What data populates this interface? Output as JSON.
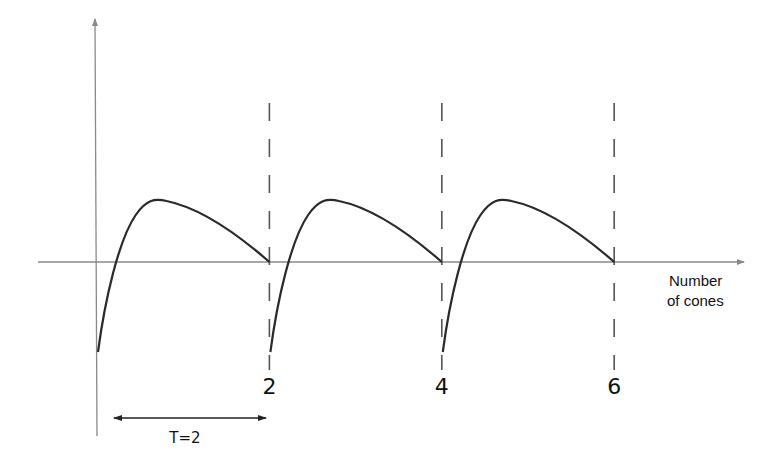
{
  "diagram": {
    "type": "periodic-curve",
    "x_axis_label_line1": "Number",
    "x_axis_label_line2": "of cones",
    "period_label": "T=2",
    "period": 2,
    "tick_labels": [
      "2",
      "4",
      "6"
    ],
    "tick_values": [
      2,
      4,
      6
    ],
    "periods_shown": 3,
    "colors": {
      "axis": "#8a8a8a",
      "curve": "#2a2a2a",
      "dashes": "#555555",
      "text": "#111111"
    }
  }
}
